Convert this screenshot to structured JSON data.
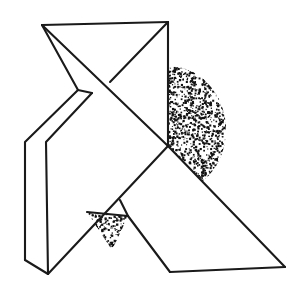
{
  "figure": {
    "canvas": {
      "width": 303,
      "height": 289,
      "background": "#ffffff"
    },
    "ink_color": "#1a1a1a",
    "stipple_color": "#111111",
    "stroke_width": 2.1,
    "stipple_regions": [
      {
        "name": "large-half-ellipse",
        "shape": "half-ellipse",
        "center_x": 168,
        "center_y": 130,
        "radius_x": 58,
        "radius_y": 64,
        "clip_note": "right half of ellipse, lower-right corner trimmed by diagonal edge",
        "density": 0.55,
        "dot_count": 2600
      },
      {
        "name": "small-triangle-patch",
        "shape": "triangle",
        "points": "87,212 128,216 112,250",
        "density": 0.5,
        "dot_count": 420
      }
    ],
    "vertices": {
      "top_left": [
        42,
        25
      ],
      "top_right": [
        168,
        22
      ],
      "x_crossing": [
        110,
        82
      ],
      "fold_tip_left": [
        78,
        90
      ],
      "fold_inner": [
        92,
        93
      ],
      "bend_left_outer": [
        25,
        142
      ],
      "bend_left_inner": [
        46,
        142
      ],
      "bottom_left_outer": [
        25,
        260
      ],
      "bottom_left_inner": [
        48,
        274
      ],
      "center_junction": [
        168,
        146
      ],
      "lower_patch_left": [
        87,
        212
      ],
      "lower_patch_right": [
        128,
        216
      ],
      "lower_patch_bottom": [
        112,
        250
      ],
      "bottom_center": [
        170,
        272
      ],
      "bottom_right": [
        285,
        267
      ],
      "mid_upper_stem": [
        120,
        200
      ]
    },
    "paths": [
      {
        "name": "top-edge",
        "d": "M 42 25 L 168 22"
      },
      {
        "name": "right-vertical-upper",
        "d": "M 168 22 L 168 146"
      },
      {
        "name": "diagonal-top-right-to-x",
        "d": "M 168 22 L 110 82"
      },
      {
        "name": "diagonal-topleft-to-center",
        "d": "M 42 25 L 168 146"
      },
      {
        "name": "fold-crease-upper",
        "d": "M 42 25 L 78 90"
      },
      {
        "name": "fold-crease-short",
        "d": "M 78 90 L 92 93"
      },
      {
        "name": "fold-left-outer",
        "d": "M 78 90 L 25 142 L 25 260"
      },
      {
        "name": "fold-left-inner",
        "d": "M 92 93 L 46 142 L 48 274"
      },
      {
        "name": "fold-bottom-connector",
        "d": "M 25 260 L 48 274"
      },
      {
        "name": "lower-left-long-diagonal",
        "d": "M 48 274 L 168 146"
      },
      {
        "name": "center-to-bottom-right",
        "d": "M 168 146 L 285 267"
      },
      {
        "name": "bottom-edge-right",
        "d": "M 285 267 L 170 272"
      },
      {
        "name": "bottom-edge-left",
        "d": "M 170 272 L 128 216"
      },
      {
        "name": "patch-horizontal",
        "d": "M 87 212 L 128 216"
      },
      {
        "name": "patch-stem",
        "d": "M 128 216 L 120 200"
      }
    ]
  }
}
